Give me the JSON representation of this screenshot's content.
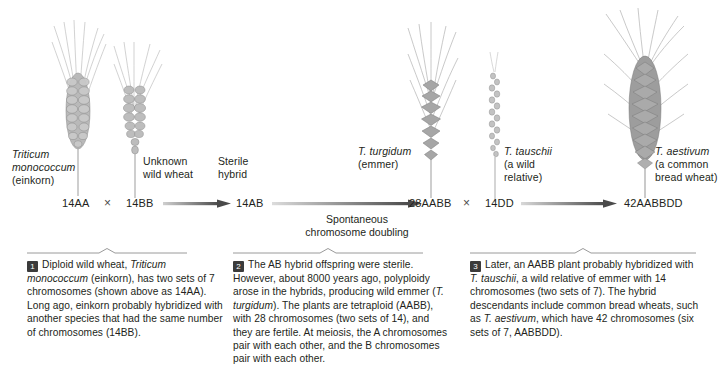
{
  "figure": {
    "ink_color": "#231f20",
    "plant_color": "#9a9a9a",
    "arrow_color": "#555555",
    "badge_color": "#3b3b3b"
  },
  "plants": [
    {
      "id": "einkorn",
      "icon": "wheat-spike-icon",
      "label_lines": [
        "Triticum",
        "monococcum",
        "(einkorn)"
      ],
      "italic_lines": [
        0,
        1
      ]
    },
    {
      "id": "unknown-wild-wheat",
      "icon": "wheat-spike-icon",
      "label_lines": [
        "Unknown",
        "wild wheat"
      ],
      "italic_lines": []
    },
    {
      "id": "t-turgidum",
      "icon": "wheat-spike-icon",
      "label_lines": [
        "T. turgidum",
        "(emmer)"
      ],
      "italic_lines": [
        0
      ]
    },
    {
      "id": "t-tauschii",
      "icon": "wheat-spike-icon",
      "label_lines": [
        "T. tauschii",
        "(a wild",
        "relative)"
      ],
      "italic_lines": [
        0
      ]
    },
    {
      "id": "t-aestivum",
      "icon": "wheat-spike-icon",
      "label_lines": [
        "T. aestivum",
        "(a common",
        "bread wheat)"
      ],
      "italic_lines": [
        0
      ]
    }
  ],
  "sterile_hybrid_label": {
    "line1": "Sterile",
    "line2": "hybrid"
  },
  "chromosome_row": {
    "einkorn": "14AA",
    "cross1": "×",
    "wild_wheat": "14BB",
    "hybrid": "14AB",
    "emmer": "28AABB",
    "cross2": "×",
    "tauschii": "14DD",
    "bread_wheat": "42AABBDD"
  },
  "annotations": {
    "doubling_line1": "Spontaneous",
    "doubling_line2": "chromosome doubling"
  },
  "captions": [
    {
      "number": "1",
      "name": "caption-one",
      "text_runs": [
        {
          "t": "Diploid wild wheat, ",
          "i": false
        },
        {
          "t": "Triticum monococcum",
          "i": true
        },
        {
          "t": " (einkorn), has two sets of 7 chromosomes (shown above as 14AA). Long ago, einkorn probably hybridized with another species that had the same number of chromosomes (14BB).",
          "i": false
        }
      ]
    },
    {
      "number": "2",
      "name": "caption-two",
      "text_runs": [
        {
          "t": "The AB hybrid offspring were sterile. However, about 8000 years ago, polyploidy arose in the hybrids, producing wild emmer (",
          "i": false
        },
        {
          "t": "T. turgidum",
          "i": true
        },
        {
          "t": "). The plants are tetraploid (AABB), with 28 chromosomes (two sets of 14), and they are fertile. At meiosis, the A chromosomes pair with each other, and the B chromosomes pair with each other.",
          "i": false
        }
      ]
    },
    {
      "number": "3",
      "name": "caption-three",
      "text_runs": [
        {
          "t": "Later, an AABB plant probably hybridized with ",
          "i": false
        },
        {
          "t": "T. tauschii",
          "i": true
        },
        {
          "t": ", a wild relative of emmer with 14 chromosomes (two sets of 7). The hybrid descendants include common bread wheats, such as ",
          "i": false
        },
        {
          "t": "T. aestivum",
          "i": true
        },
        {
          "t": ", which have 42 chromosomes (six sets of 7, AABBDD).",
          "i": false
        }
      ]
    }
  ]
}
